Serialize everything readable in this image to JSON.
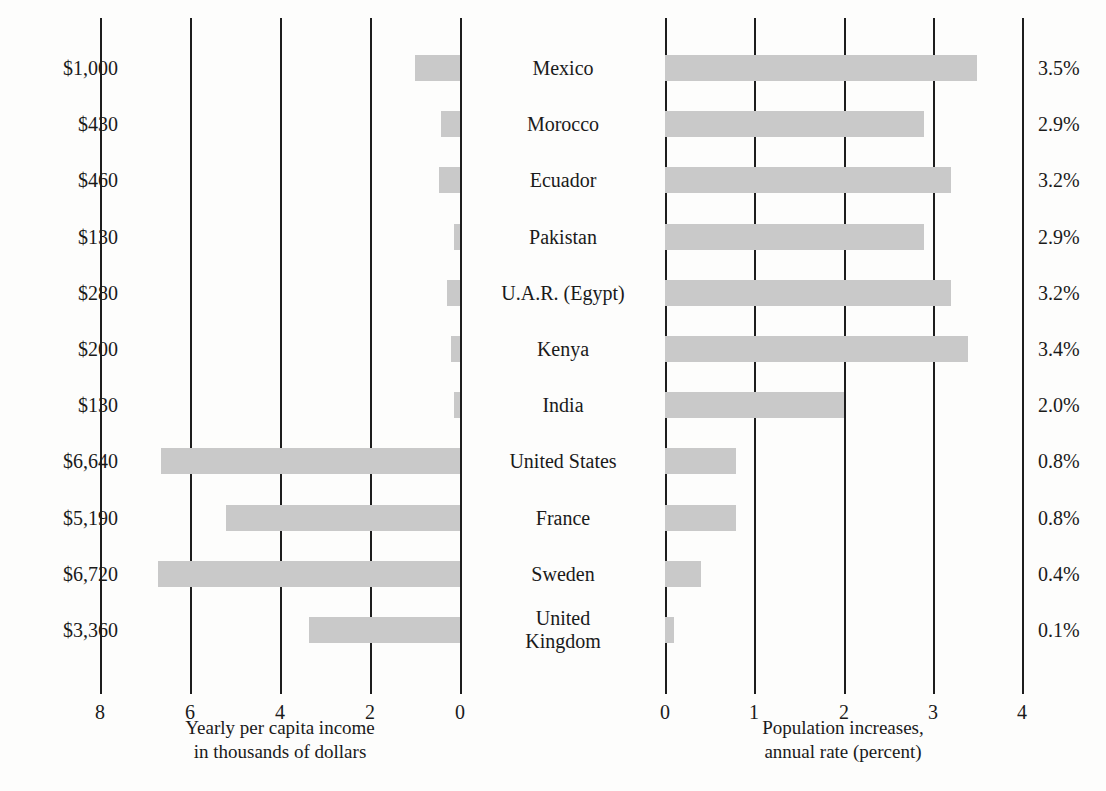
{
  "chart_data": {
    "type": "bar",
    "title": "",
    "orientation": "horizontal",
    "layout": "back-to-back bidirectional bar chart",
    "grid": true,
    "legend_position": "none",
    "categories": [
      "Mexico",
      "Morocco",
      "Ecuador",
      "Pakistan",
      "U.A.R. (Egypt)",
      "Kenya",
      "India",
      "United States",
      "France",
      "Sweden",
      "United\nKingdom"
    ],
    "panels": [
      {
        "id": "income",
        "side": "left",
        "xlabel": "Yearly per capita income\nin thousands of dollars",
        "xlim": [
          8,
          0
        ],
        "direction": "right-to-left",
        "ticks": [
          8,
          6,
          4,
          2,
          0
        ],
        "tick_labels": [
          "8",
          "6",
          "4",
          "2",
          "0"
        ],
        "units": "thousands of dollars",
        "values": [
          1.0,
          0.43,
          0.46,
          0.13,
          0.28,
          0.2,
          0.13,
          6.64,
          5.19,
          6.72,
          3.36
        ],
        "data_labels": [
          "$1,000",
          "$430",
          "$460",
          "$130",
          "$280",
          "$200",
          "$130",
          "$6,640",
          "$5,190",
          "$6,720",
          "$3,360"
        ]
      },
      {
        "id": "population",
        "side": "right",
        "xlabel": "Population increases,\nannual rate (percent)",
        "xlim": [
          0,
          4
        ],
        "direction": "left-to-right",
        "ticks": [
          0,
          1,
          2,
          3,
          4
        ],
        "tick_labels": [
          "0",
          "1",
          "2",
          "3",
          "4"
        ],
        "units": "percent",
        "values": [
          3.5,
          2.9,
          3.2,
          2.9,
          3.2,
          3.4,
          2.0,
          0.8,
          0.8,
          0.4,
          0.1
        ],
        "data_labels": [
          "3.5%",
          "2.9%",
          "3.2%",
          "2.9%",
          "3.2%",
          "3.4%",
          "2.0%",
          "0.8%",
          "0.8%",
          "0.4%",
          "0.1%"
        ]
      }
    ],
    "colors": {
      "bar": "#c9c9c9",
      "gridline": "#1d1d1d",
      "text": "#1a1a1a",
      "background": "#fdfdfc"
    }
  }
}
